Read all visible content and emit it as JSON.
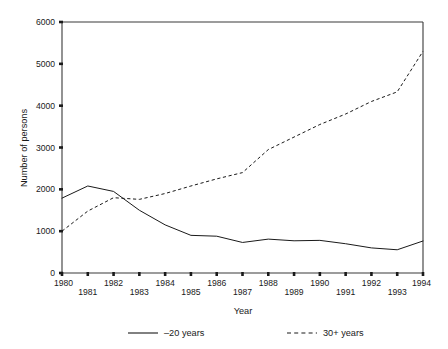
{
  "chart_data": {
    "type": "line",
    "title": "",
    "xlabel": "Year",
    "ylabel": "Number of persons",
    "x": [
      1980,
      1981,
      1982,
      1983,
      1984,
      1985,
      1986,
      1987,
      1988,
      1989,
      1990,
      1991,
      1992,
      1993,
      1994
    ],
    "xtick_labels": [
      "1980",
      "1981",
      "1982",
      "1983",
      "1984",
      "1985",
      "1986",
      "1987",
      "1988",
      "1989",
      "1990",
      "1991",
      "1992",
      "1993",
      "1994"
    ],
    "ytick_labels": [
      "0",
      "1000",
      "2000",
      "3000",
      "4000",
      "5000",
      "6000"
    ],
    "ytick_values": [
      0,
      1000,
      2000,
      3000,
      4000,
      5000,
      6000
    ],
    "xlim": [
      1980,
      1994
    ],
    "ylim": [
      0,
      6000
    ],
    "grid": false,
    "legend_position": "bottom",
    "xtick_label_stagger": true,
    "series": [
      {
        "name": "–20 years",
        "style": "solid",
        "color": "#1a1a1a",
        "values": [
          1790,
          2080,
          1950,
          1500,
          1150,
          900,
          880,
          730,
          810,
          770,
          780,
          700,
          600,
          555,
          765
        ]
      },
      {
        "name": "30+ years",
        "style": "dashed",
        "color": "#1a1a1a",
        "values": [
          1000,
          1480,
          1800,
          1760,
          1900,
          2080,
          2250,
          2400,
          2950,
          3250,
          3550,
          3800,
          4100,
          4330,
          5300
        ]
      }
    ]
  },
  "legend": {
    "items": [
      {
        "label": "–20 years",
        "style": "solid"
      },
      {
        "label": "30+ years",
        "style": "dashed"
      }
    ]
  }
}
